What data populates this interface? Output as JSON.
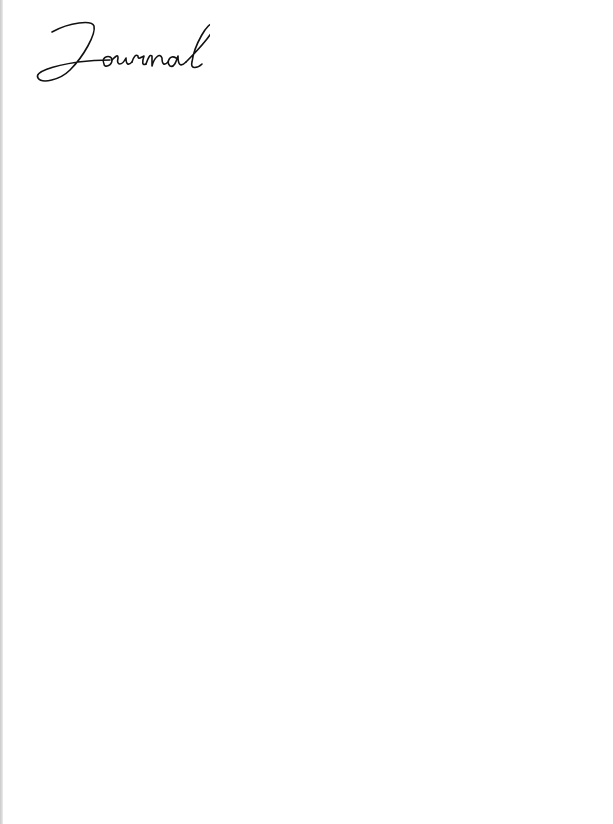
{
  "page": {
    "line_count": 27,
    "line_color": "#b4b4b4",
    "background": "#ffffff"
  }
}
